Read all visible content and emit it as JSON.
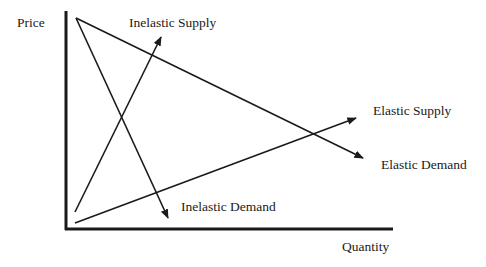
{
  "diagram": {
    "title": "",
    "axes": {
      "y_label": "Price",
      "x_label": "Quantity"
    },
    "curves": [
      {
        "name": "Inelastic Supply",
        "type": "supply",
        "elasticity": "inelastic",
        "from": [
          75,
          212
        ],
        "to": [
          161,
          37
        ]
      },
      {
        "name": "Elastic Supply",
        "type": "supply",
        "elasticity": "elastic",
        "from": [
          75,
          223
        ],
        "to": [
          356,
          118
        ]
      },
      {
        "name": "Inelastic Demand",
        "type": "demand",
        "elasticity": "inelastic",
        "from": [
          76,
          18
        ],
        "to": [
          168,
          218
        ]
      },
      {
        "name": "Elastic Demand",
        "type": "demand",
        "elasticity": "elastic",
        "from": [
          76,
          18
        ],
        "to": [
          363,
          158
        ]
      }
    ],
    "labels": {
      "inelastic_supply": "Inelastic Supply",
      "elastic_supply": "Elastic Supply",
      "inelastic_demand": "Inelastic Demand",
      "elastic_demand": "Elastic Demand"
    },
    "colors": {
      "line": "#1a1a1a",
      "background": "#ffffff"
    }
  }
}
